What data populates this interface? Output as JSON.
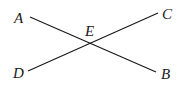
{
  "diagram": {
    "type": "intersecting-line-segments",
    "points": {
      "A": {
        "label": "A",
        "x": 30,
        "y": 17
      },
      "B": {
        "label": "B",
        "x": 156,
        "y": 72
      },
      "C": {
        "label": "C",
        "x": 158,
        "y": 13
      },
      "D": {
        "label": "D",
        "x": 28,
        "y": 71
      },
      "E": {
        "label": "E",
        "x": 89,
        "y": 43
      }
    },
    "segments": [
      {
        "name": "AB",
        "from": "A",
        "to": "B"
      },
      {
        "name": "DC",
        "from": "D",
        "to": "C"
      }
    ],
    "labels": {
      "A": "A",
      "B": "B",
      "C": "C",
      "D": "D",
      "E": "E"
    },
    "colors": {
      "stroke": "#1a1a1a",
      "background": "#ffffff"
    }
  }
}
